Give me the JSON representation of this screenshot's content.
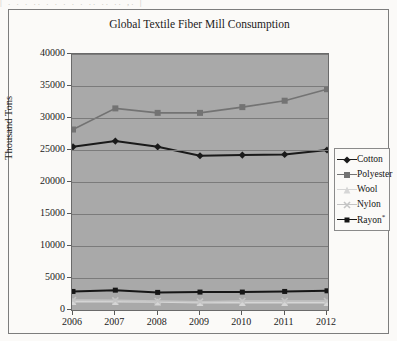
{
  "scan_artifact_text": "|  .    . .     ..      . .  .   .     .     ..   ..  ..   ,. |",
  "chart_data": {
    "type": "line",
    "title": "Global Textile Fiber Mill Consumption",
    "xlabel": "",
    "ylabel": "Thousand Tons",
    "categories": [
      "2006",
      "2007",
      "2008",
      "2009",
      "2010",
      "2011",
      "2012"
    ],
    "ylim": [
      0,
      40000
    ],
    "yticks": [
      "0",
      "5000",
      "10000",
      "15000",
      "20000",
      "25000",
      "30000",
      "35000",
      "40000"
    ],
    "ytick_values": [
      0,
      5000,
      10000,
      15000,
      20000,
      25000,
      30000,
      35000,
      40000
    ],
    "grid": true,
    "legend_position": "right",
    "plot_background": "#a9a9a9",
    "series": [
      {
        "name": "Cotton",
        "values": [
          25500,
          26400,
          25500,
          24100,
          24200,
          24300,
          25000
        ],
        "color": "#1a1a1a",
        "marker": "diamond"
      },
      {
        "name": "Polyester",
        "values": [
          28200,
          31500,
          30800,
          30800,
          31700,
          32700,
          34500
        ],
        "color": "#737373",
        "marker": "square"
      },
      {
        "name": "Wool",
        "values": [
          1300,
          1300,
          1250,
          1150,
          1150,
          1150,
          1150
        ],
        "color": "#d6d6d6",
        "marker": "triangle"
      },
      {
        "name": "Nylon",
        "values": [
          1550,
          1500,
          1400,
          1300,
          1400,
          1400,
          1400
        ],
        "color": "#c4c4c4",
        "marker": "cross"
      },
      {
        "name": "Rayon",
        "values": [
          2900,
          3100,
          2750,
          2800,
          2800,
          2900,
          3000
        ],
        "color": "#161616",
        "marker": "star-square"
      }
    ]
  },
  "legend": {
    "items": [
      {
        "label": "Cotton",
        "suffix": ""
      },
      {
        "label": "Polyester",
        "suffix": ""
      },
      {
        "label": "Wool",
        "suffix": ""
      },
      {
        "label": "Nylon",
        "suffix": ""
      },
      {
        "label": "Rayon",
        "suffix": "*"
      }
    ]
  }
}
